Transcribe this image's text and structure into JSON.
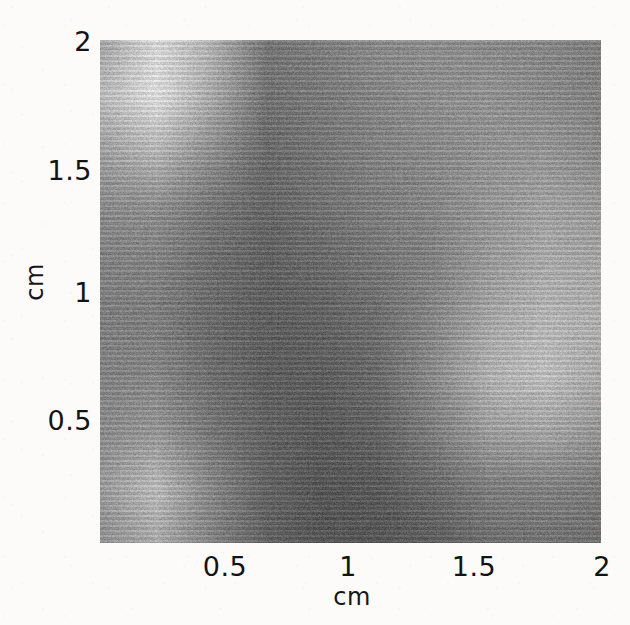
{
  "figure": {
    "type": "heatmap-image-plot",
    "title": ""
  },
  "axes": {
    "x": {
      "label": "cm",
      "ticks": [
        "0.5",
        "1",
        "1.5",
        "2"
      ],
      "tick_values": [
        0.5,
        1,
        1.5,
        2
      ],
      "range": [
        0,
        2
      ]
    },
    "y": {
      "label": "cm",
      "ticks": [
        "0.5",
        "1",
        "1.5",
        "2"
      ],
      "tick_values": [
        0.5,
        1,
        1.5,
        2
      ],
      "range": [
        0,
        2
      ]
    }
  },
  "chart_data": {
    "type": "heatmap",
    "title": "",
    "xlabel": "cm",
    "ylabel": "cm",
    "xlim": [
      0,
      2
    ],
    "ylim": [
      0,
      2
    ],
    "grid": false,
    "legend": "none",
    "colormap": "gray",
    "value_range": [
      0,
      1
    ],
    "x_ticks": [
      0.5,
      1,
      1.5,
      2
    ],
    "y_ticks": [
      0.5,
      1,
      1.5,
      2
    ],
    "x": [
      0.1,
      0.3,
      0.5,
      0.7,
      0.9,
      1.1,
      1.3,
      1.5,
      1.7,
      1.9
    ],
    "y": [
      1.9,
      1.7,
      1.5,
      1.3,
      1.1,
      0.9,
      0.7,
      0.5,
      0.3,
      0.1
    ],
    "values": [
      [
        0.62,
        0.88,
        0.7,
        0.4,
        0.44,
        0.5,
        0.52,
        0.5,
        0.48,
        0.44
      ],
      [
        0.74,
        0.92,
        0.66,
        0.38,
        0.42,
        0.48,
        0.52,
        0.54,
        0.5,
        0.46
      ],
      [
        0.6,
        0.72,
        0.52,
        0.34,
        0.4,
        0.46,
        0.5,
        0.54,
        0.56,
        0.5
      ],
      [
        0.5,
        0.52,
        0.4,
        0.32,
        0.38,
        0.44,
        0.48,
        0.56,
        0.62,
        0.58
      ],
      [
        0.46,
        0.46,
        0.36,
        0.3,
        0.34,
        0.4,
        0.46,
        0.58,
        0.66,
        0.64
      ],
      [
        0.44,
        0.44,
        0.34,
        0.28,
        0.3,
        0.36,
        0.48,
        0.64,
        0.72,
        0.68
      ],
      [
        0.46,
        0.48,
        0.36,
        0.28,
        0.28,
        0.34,
        0.5,
        0.7,
        0.76,
        0.66
      ],
      [
        0.5,
        0.56,
        0.4,
        0.3,
        0.26,
        0.3,
        0.44,
        0.6,
        0.64,
        0.56
      ],
      [
        0.58,
        0.74,
        0.48,
        0.3,
        0.24,
        0.26,
        0.34,
        0.44,
        0.46,
        0.42
      ],
      [
        0.52,
        0.66,
        0.46,
        0.3,
        0.24,
        0.24,
        0.28,
        0.36,
        0.38,
        0.36
      ]
    ],
    "annotations": [
      "bright maximum near x=0.3 cm, y=1.8 cm",
      "bright secondary maximum near x=0.35 cm, y=0.25 cm",
      "bright region near x=1.7 cm, y=0.65 cm",
      "dark minimum band near x=0.9-1.2 cm across the centre"
    ]
  },
  "colors": {
    "background": "#fcfbf9",
    "plot_base": "#6e6e6e",
    "text": "#131313"
  }
}
